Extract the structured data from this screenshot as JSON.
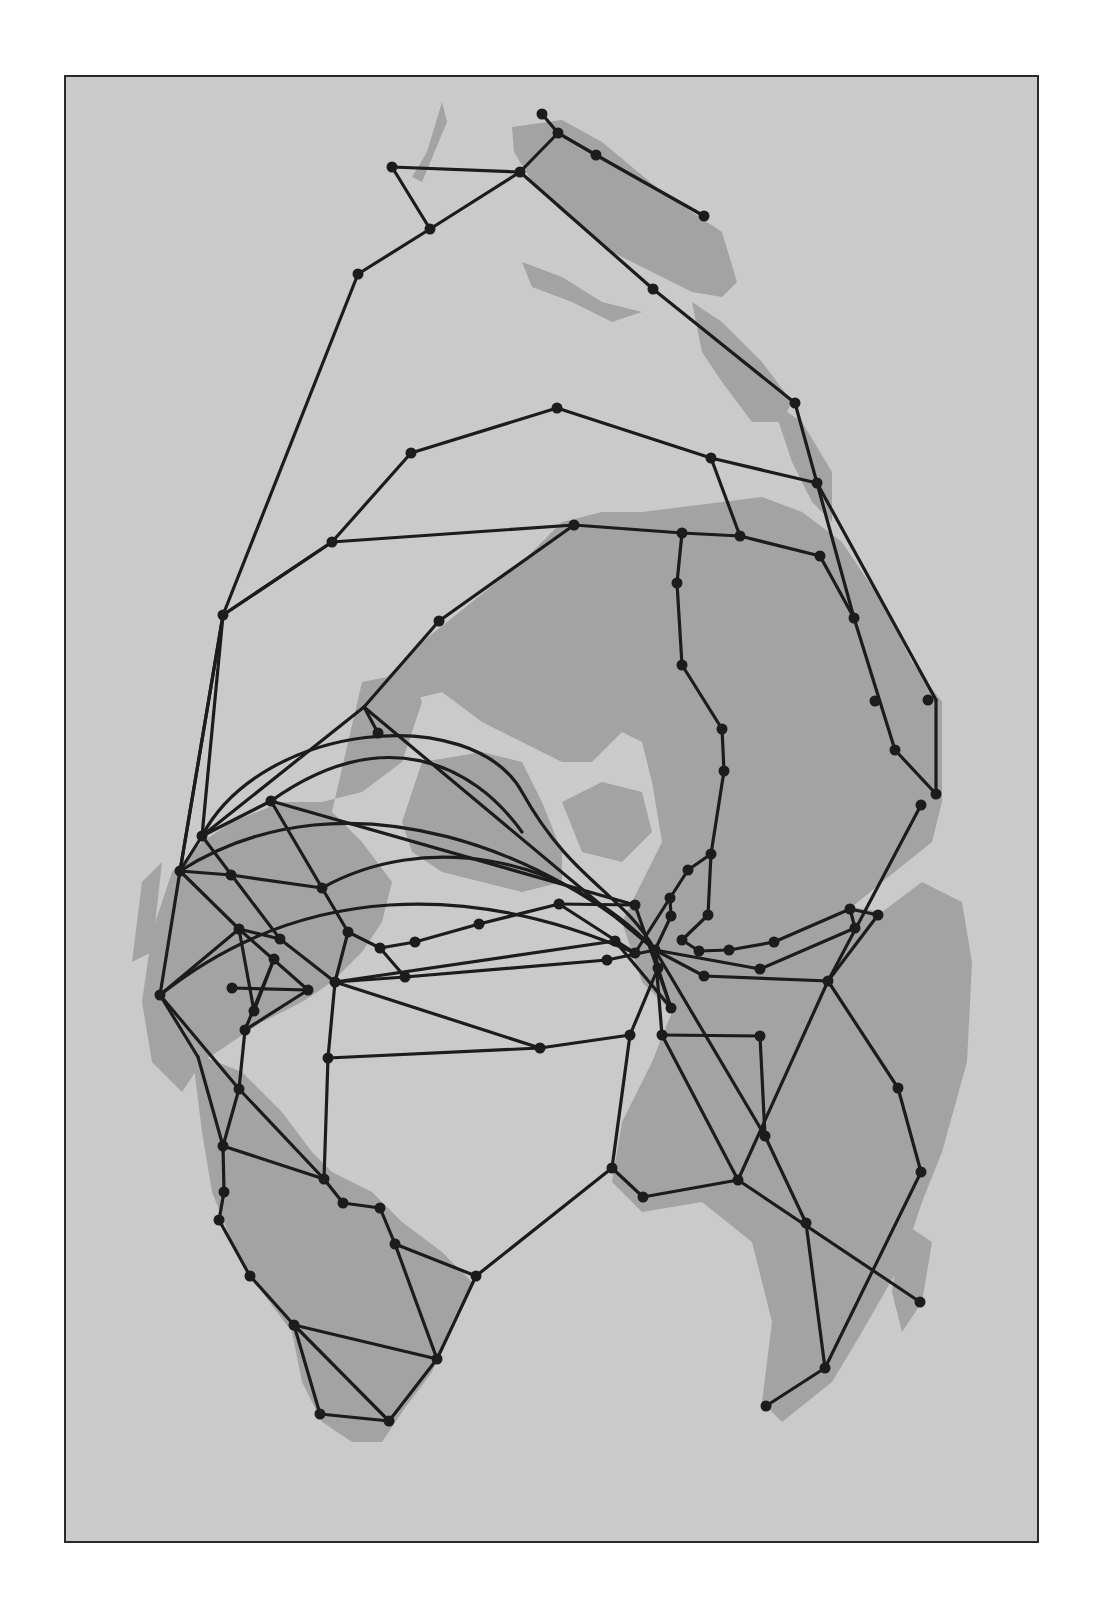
{
  "map": {
    "type": "network-map",
    "background_color": "#cacaca",
    "land_color": "#a3a3a3",
    "line_color": "#1c1c1c",
    "frame_color": "#2a2a2a",
    "nodes": [
      [
        540,
        112
      ],
      [
        556,
        131
      ],
      [
        594,
        153
      ],
      [
        702,
        214
      ],
      [
        390,
        165
      ],
      [
        518,
        170
      ],
      [
        428,
        227
      ],
      [
        651,
        287
      ],
      [
        356,
        272
      ],
      [
        793,
        401
      ],
      [
        709,
        456
      ],
      [
        815,
        481
      ],
      [
        680,
        531
      ],
      [
        738,
        534
      ],
      [
        818,
        554
      ],
      [
        675,
        581
      ],
      [
        852,
        616
      ],
      [
        680,
        663
      ],
      [
        873,
        699
      ],
      [
        926,
        698
      ],
      [
        720,
        727
      ],
      [
        893,
        748
      ],
      [
        722,
        769
      ],
      [
        934,
        792
      ],
      [
        919,
        803
      ],
      [
        555,
        406
      ],
      [
        409,
        451
      ],
      [
        330,
        540
      ],
      [
        572,
        523
      ],
      [
        221,
        613
      ],
      [
        437,
        619
      ],
      [
        376,
        731
      ],
      [
        269,
        799
      ],
      [
        200,
        834
      ],
      [
        178,
        869
      ],
      [
        229,
        873
      ],
      [
        320,
        886
      ],
      [
        237,
        927
      ],
      [
        278,
        937
      ],
      [
        272,
        957
      ],
      [
        346,
        930
      ],
      [
        230,
        986
      ],
      [
        306,
        988
      ],
      [
        333,
        980
      ],
      [
        252,
        1009
      ],
      [
        243,
        1028
      ],
      [
        158,
        993
      ],
      [
        403,
        975
      ],
      [
        378,
        946
      ],
      [
        413,
        940
      ],
      [
        477,
        922
      ],
      [
        557,
        902
      ],
      [
        633,
        903
      ],
      [
        668,
        896
      ],
      [
        686,
        868
      ],
      [
        709,
        852
      ],
      [
        669,
        914
      ],
      [
        706,
        913
      ],
      [
        680,
        938
      ],
      [
        613,
        939
      ],
      [
        605,
        958
      ],
      [
        633,
        951
      ],
      [
        653,
        948
      ],
      [
        656,
        966
      ],
      [
        697,
        949
      ],
      [
        727,
        948
      ],
      [
        702,
        974
      ],
      [
        758,
        967
      ],
      [
        669,
        1006
      ],
      [
        772,
        940
      ],
      [
        848,
        907
      ],
      [
        853,
        926
      ],
      [
        876,
        913
      ],
      [
        826,
        979
      ],
      [
        660,
        1033
      ],
      [
        758,
        1034
      ],
      [
        896,
        1086
      ],
      [
        763,
        1134
      ],
      [
        919,
        1170
      ],
      [
        610,
        1166
      ],
      [
        641,
        1195
      ],
      [
        736,
        1178
      ],
      [
        804,
        1221
      ],
      [
        918,
        1300
      ],
      [
        823,
        1366
      ],
      [
        764,
        1404
      ],
      [
        237,
        1087
      ],
      [
        326,
        1056
      ],
      [
        538,
        1046
      ],
      [
        628,
        1033
      ],
      [
        221,
        1144
      ],
      [
        322,
        1177
      ],
      [
        341,
        1201
      ],
      [
        378,
        1206
      ],
      [
        393,
        1242
      ],
      [
        222,
        1190
      ],
      [
        217,
        1218
      ],
      [
        248,
        1274
      ],
      [
        474,
        1274
      ],
      [
        292,
        1323
      ],
      [
        435,
        1357
      ],
      [
        318,
        1412
      ],
      [
        387,
        1419
      ]
    ],
    "edges": [
      [
        540,
        112,
        556,
        131
      ],
      [
        556,
        131,
        594,
        153
      ],
      [
        594,
        153,
        702,
        214
      ],
      [
        556,
        131,
        518,
        170
      ],
      [
        390,
        165,
        518,
        170
      ],
      [
        390,
        165,
        428,
        227
      ],
      [
        428,
        227,
        518,
        170
      ],
      [
        518,
        170,
        651,
        287
      ],
      [
        651,
        287,
        793,
        401
      ],
      [
        793,
        401,
        815,
        481
      ],
      [
        428,
        227,
        356,
        272
      ],
      [
        356,
        272,
        221,
        613
      ],
      [
        555,
        406,
        409,
        451
      ],
      [
        409,
        451,
        330,
        540
      ],
      [
        555,
        406,
        709,
        456
      ],
      [
        709,
        456,
        815,
        481
      ],
      [
        709,
        456,
        738,
        534
      ],
      [
        330,
        540,
        572,
        523
      ],
      [
        572,
        523,
        680,
        531
      ],
      [
        680,
        531,
        738,
        534
      ],
      [
        738,
        534,
        818,
        554
      ],
      [
        815,
        481,
        852,
        616
      ],
      [
        815,
        481,
        934,
        698
      ],
      [
        818,
        554,
        852,
        616
      ],
      [
        852,
        616,
        893,
        748
      ],
      [
        934,
        698,
        934,
        792
      ],
      [
        893,
        748,
        934,
        792
      ],
      [
        893,
        748,
        893,
        748
      ],
      [
        680,
        531,
        675,
        581
      ],
      [
        675,
        581,
        680,
        663
      ],
      [
        680,
        663,
        720,
        727
      ],
      [
        720,
        727,
        722,
        769
      ],
      [
        722,
        769,
        709,
        852
      ],
      [
        709,
        852,
        706,
        913
      ],
      [
        709,
        852,
        686,
        868
      ],
      [
        686,
        868,
        668,
        896
      ],
      [
        221,
        613,
        330,
        540
      ],
      [
        221,
        613,
        200,
        834
      ],
      [
        221,
        613,
        178,
        869
      ],
      [
        572,
        523,
        437,
        619
      ],
      [
        437,
        619,
        362,
        705
      ],
      [
        362,
        705,
        376,
        731
      ],
      [
        362,
        705,
        200,
        834
      ],
      [
        362,
        705,
        653,
        948
      ],
      [
        330,
        540,
        221,
        613
      ],
      [
        200,
        834,
        269,
        799
      ],
      [
        269,
        799,
        320,
        886
      ],
      [
        269,
        799,
        633,
        903
      ],
      [
        200,
        834,
        178,
        869
      ],
      [
        178,
        869,
        158,
        993
      ],
      [
        178,
        869,
        229,
        873
      ],
      [
        229,
        873,
        320,
        886
      ],
      [
        200,
        834,
        278,
        937
      ],
      [
        178,
        869,
        237,
        927
      ],
      [
        237,
        927,
        278,
        937
      ],
      [
        320,
        886,
        346,
        930
      ],
      [
        346,
        930,
        333,
        980
      ],
      [
        237,
        927,
        252,
        1009
      ],
      [
        237,
        927,
        306,
        988
      ],
      [
        278,
        937,
        333,
        980
      ],
      [
        272,
        957,
        252,
        1009
      ],
      [
        272,
        957,
        243,
        1028
      ],
      [
        230,
        986,
        306,
        988
      ],
      [
        158,
        993,
        237,
        927
      ],
      [
        306,
        988,
        243,
        1028
      ],
      [
        158,
        993,
        196,
        1055
      ],
      [
        346,
        930,
        378,
        946
      ],
      [
        378,
        946,
        413,
        940
      ],
      [
        413,
        940,
        477,
        922
      ],
      [
        477,
        922,
        557,
        902
      ],
      [
        557,
        902,
        633,
        903
      ],
      [
        378,
        946,
        403,
        975
      ],
      [
        333,
        980,
        403,
        975
      ],
      [
        403,
        975,
        605,
        958
      ],
      [
        333,
        980,
        613,
        939
      ],
      [
        605,
        958,
        653,
        948
      ],
      [
        633,
        903,
        669,
        1006
      ],
      [
        557,
        902,
        633,
        951
      ],
      [
        668,
        896,
        633,
        951
      ],
      [
        668,
        896,
        669,
        914
      ],
      [
        669,
        914,
        653,
        948
      ],
      [
        706,
        913,
        680,
        938
      ],
      [
        680,
        938,
        697,
        949
      ],
      [
        697,
        949,
        727,
        948
      ],
      [
        727,
        948,
        772,
        940
      ],
      [
        772,
        940,
        848,
        907
      ],
      [
        848,
        907,
        876,
        913
      ],
      [
        848,
        907,
        853,
        926
      ],
      [
        853,
        926,
        758,
        967
      ],
      [
        876,
        913,
        826,
        979
      ],
      [
        919,
        803,
        826,
        979
      ],
      [
        653,
        948,
        702,
        974
      ],
      [
        702,
        974,
        826,
        979
      ],
      [
        653,
        948,
        758,
        967
      ],
      [
        653,
        948,
        656,
        966
      ],
      [
        656,
        966,
        669,
        1006
      ],
      [
        613,
        939,
        669,
        1006
      ],
      [
        333,
        980,
        326,
        1056
      ],
      [
        326,
        1056,
        538,
        1046
      ],
      [
        538,
        1046,
        628,
        1033
      ],
      [
        333,
        980,
        538,
        1046
      ],
      [
        628,
        1033,
        656,
        966
      ],
      [
        628,
        1033,
        610,
        1166
      ],
      [
        653,
        948,
        660,
        1033
      ],
      [
        660,
        1033,
        758,
        1034
      ],
      [
        653,
        948,
        763,
        1134
      ],
      [
        758,
        1034,
        763,
        1134
      ],
      [
        826,
        979,
        896,
        1086
      ],
      [
        896,
        1086,
        919,
        1170
      ],
      [
        919,
        1170,
        823,
        1366
      ],
      [
        826,
        979,
        736,
        1178
      ],
      [
        610,
        1166,
        641,
        1195
      ],
      [
        641,
        1195,
        736,
        1178
      ],
      [
        736,
        1178,
        918,
        1300
      ],
      [
        763,
        1134,
        804,
        1221
      ],
      [
        804,
        1221,
        823,
        1366
      ],
      [
        823,
        1366,
        764,
        1404
      ],
      [
        660,
        1033,
        736,
        1178
      ],
      [
        610,
        1166,
        474,
        1274
      ],
      [
        243,
        1028,
        237,
        1087
      ],
      [
        237,
        1087,
        221,
        1144
      ],
      [
        196,
        1055,
        221,
        1144
      ],
      [
        221,
        1144,
        322,
        1177
      ],
      [
        237,
        1087,
        322,
        1177
      ],
      [
        326,
        1056,
        322,
        1177
      ],
      [
        322,
        1177,
        341,
        1201
      ],
      [
        341,
        1201,
        378,
        1206
      ],
      [
        378,
        1206,
        393,
        1242
      ],
      [
        221,
        1144,
        222,
        1190
      ],
      [
        222,
        1190,
        217,
        1218
      ],
      [
        217,
        1218,
        248,
        1274
      ],
      [
        248,
        1274,
        292,
        1323
      ],
      [
        393,
        1242,
        474,
        1274
      ],
      [
        393,
        1242,
        435,
        1357
      ],
      [
        474,
        1274,
        435,
        1357
      ],
      [
        292,
        1323,
        435,
        1357
      ],
      [
        292,
        1323,
        318,
        1412
      ],
      [
        292,
        1323,
        387,
        1419
      ],
      [
        318,
        1412,
        387,
        1419
      ],
      [
        435,
        1357,
        387,
        1419
      ],
      [
        221,
        613,
        178,
        869
      ],
      [
        158,
        993,
        237,
        1087
      ]
    ],
    "arcs": [
      "M200,834 C260,720 470,700 520,790 S620,890 653,948",
      "M269,799 C380,720 470,760 520,830",
      "M178,869 C350,760 560,860 653,948",
      "M320,886 C420,830 560,850 653,948",
      "M158,993 C300,880 470,880 633,951"
    ],
    "land_paths": [
      "M440,100 L425,150 L410,175 L420,180 L445,120 Z",
      "M510,125 L560,118 L600,140 L660,190 L720,230 L735,280 L720,295 L690,290 L650,270 L610,250 L560,210 L530,180 L512,150 Z",
      "M520,260 L560,275 L600,300 L640,310 L610,320 L570,300 L530,285 Z",
      "M690,300 L720,320 L760,360 L790,400 L780,420 L750,420 L720,380 L700,350 Z",
      "M770,400 L800,420 L830,470 L830,520 L810,500 L790,460 Z",
      "M720,500 L760,495 L800,510 L840,540 L880,600 L910,660 L940,700 L940,800 L930,840 L880,880 L850,905 L880,910 L920,880 L960,900 L970,960 L965,1060 L940,1150 L920,1200 L900,1260 L860,1330 L830,1380 L780,1420 L760,1400 L770,1320 L750,1240 L700,1200 L640,1210 L610,1180 L620,1120 L650,1060 L670,1010 L640,980 L620,920 L640,880 L660,840 L650,780 L640,740 L620,730 L590,760 L560,760 L520,740 L480,720 L440,690 L400,700 L380,680 L420,640 L470,600 L520,560 L560,520 L600,510 L640,510 L680,505 Z",
      "M540,540 L580,520 L580,560 L550,600 L540,640 L530,600 Z",
      "M360,680 L410,670 L420,700 L400,760 L360,790 L320,800 L280,800 L230,820 L200,840 L170,870 L150,930 L140,1000 L150,1060 L180,1090 L200,1060 L230,1040 L260,1020 L300,1000 L330,980 L360,950 L380,920 L390,880 L360,840 L330,810 Z",
      "M420,760 L480,750 L520,760 L540,800 L560,850 L560,880 L520,890 L480,880 L440,870 L410,850 L400,820 Z",
      "M560,800 L600,780 L640,790 L650,830 L620,860 L580,850 Z",
      "M190,1050 L240,1070 L280,1110 L310,1150 L330,1170 L370,1190 L400,1220 L440,1250 L470,1280 L450,1320 L430,1370 L400,1410 L380,1440 L350,1440 L320,1420 L300,1380 L290,1330 L260,1290 L230,1240 L210,1190 L200,1130 Z",
      "M900,1220 L930,1240 L920,1300 L900,1330 L890,1290 Z",
      "M140,880 L160,860 L150,950 L130,960 Z"
    ]
  }
}
